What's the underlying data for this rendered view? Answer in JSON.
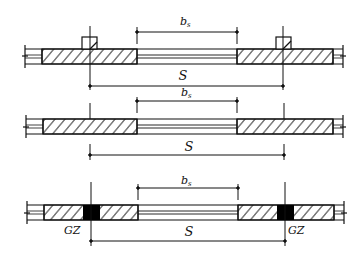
{
  "figure": {
    "panels": [
      {
        "id": "panel-pilaster",
        "top_label": "b",
        "top_label_sub": "s",
        "span_label": "S",
        "column_label": ""
      },
      {
        "id": "panel-plain",
        "top_label": "b",
        "top_label_sub": "s",
        "span_label": "S",
        "column_label": ""
      },
      {
        "id": "panel-gz",
        "top_label": "b",
        "top_label_sub": "s",
        "span_label": "S",
        "column_label_left": "GZ",
        "column_label_right": "GZ"
      }
    ],
    "colors": {
      "line": "#111111",
      "fill_column": "#000000",
      "background": "#ffffff"
    }
  }
}
